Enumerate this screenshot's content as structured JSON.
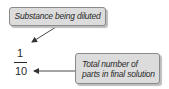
{
  "diagram": {
    "type": "annotated-fraction",
    "callouts": [
      {
        "id": "numerator-label",
        "text": "Substance being diluted",
        "points_to": "numerator"
      },
      {
        "id": "denominator-label",
        "lines": [
          "Total number of",
          "parts in final solution"
        ],
        "points_to": "denominator"
      }
    ],
    "fraction": {
      "numerator": "1",
      "denominator": "10"
    },
    "colors": {
      "callout_fill": "#dcdcdc",
      "callout_border": "#8a8a8a",
      "text": "#2a2a2a",
      "arrow": "#333333"
    }
  }
}
